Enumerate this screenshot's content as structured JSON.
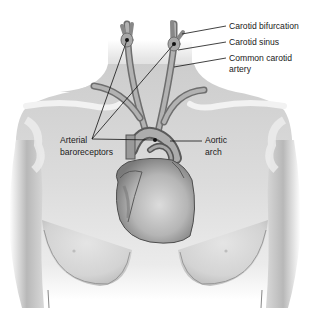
{
  "diagram": {
    "labels": {
      "carotid_bifurcation": "Carotid bifurcation",
      "carotid_sinus": "Carotid sinus",
      "common_carotid_line1": "Common carotid",
      "common_carotid_line2": "artery",
      "arterial_line1": "Arterial",
      "arterial_line2": "baroreceptors",
      "aortic_line1": "Aortic",
      "aortic_line2": "arch"
    },
    "colors": {
      "background": "#ffffff",
      "skin_light": "#e2e2e2",
      "skin_mid": "#c8c8c8",
      "skin_dark": "#9a9a9a",
      "vessel": "#8f8f8f",
      "vessel_dark": "#555555",
      "leader_line": "#111111"
    }
  }
}
